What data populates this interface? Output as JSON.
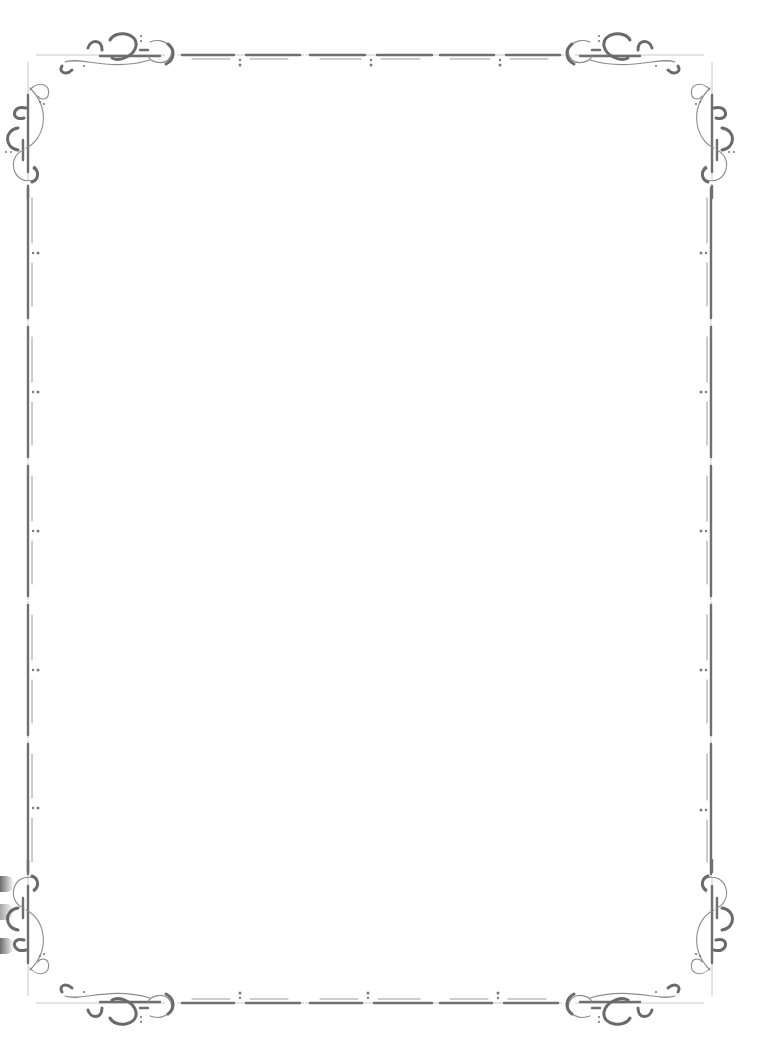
{
  "page": {
    "type": "decorative-page-border",
    "width": 772,
    "height": 1060,
    "background": "#ffffff",
    "ink_color": "#6f6f6f",
    "content_text": ""
  },
  "frame": {
    "top_y": 55,
    "bottom_y": 1003,
    "left_x": 28,
    "right_x": 711,
    "top_segments": [
      {
        "x1": 182,
        "x2": 300,
        "dot_x": 240
      },
      {
        "x1": 310,
        "x2": 432,
        "dot_x": 371
      },
      {
        "x1": 440,
        "x2": 560,
        "dot_x": 500
      }
    ],
    "bottom_segments": [
      {
        "x1": 182,
        "x2": 300,
        "dot_x": 240
      },
      {
        "x1": 310,
        "x2": 432,
        "dot_x": 368
      },
      {
        "x1": 440,
        "x2": 558,
        "dot_x": 498
      }
    ],
    "left_segments": [
      {
        "y1": 188,
        "y2": 318,
        "dot_y": 253
      },
      {
        "y1": 327,
        "y2": 457,
        "dot_y": 392
      },
      {
        "y1": 466,
        "y2": 596,
        "dot_y": 531
      },
      {
        "y1": 605,
        "y2": 735,
        "dot_y": 670
      },
      {
        "y1": 744,
        "y2": 874,
        "dot_y": 808
      }
    ],
    "right_segments": [
      {
        "y1": 188,
        "y2": 318,
        "dot_y": 253
      },
      {
        "y1": 327,
        "y2": 457,
        "dot_y": 392
      },
      {
        "y1": 466,
        "y2": 596,
        "dot_y": 531
      },
      {
        "y1": 605,
        "y2": 735,
        "dot_y": 670
      },
      {
        "y1": 744,
        "y2": 874,
        "dot_y": 810
      }
    ],
    "corner_ornaments": [
      "top-left-flourish",
      "top-right-flourish",
      "bottom-left-flourish",
      "bottom-right-flourish"
    ]
  }
}
